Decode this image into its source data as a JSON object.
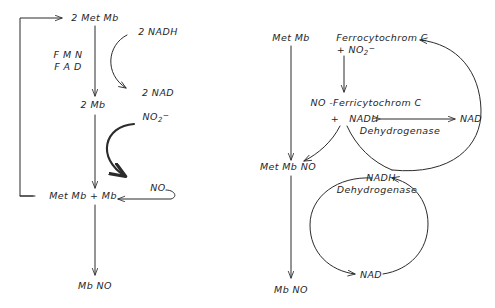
{
  "diagram": {
    "stroke_color": "#2b2b2b",
    "background": "#ffffff",
    "left_scheme": {
      "name": "FMN/FAD mediated MbNO pathway",
      "nodes": {
        "met_mb_2": "2 Met Mb",
        "mb_2": "2  Mb",
        "cofactors_line1": "F M N",
        "cofactors_line2": "F A D",
        "nadh_2": "2 NADH",
        "nad_2": "2 NAD",
        "nitrite": "NO",
        "nitrite_sub": "2",
        "nitrite_sup": "−",
        "met_mb_plus_mb": "Met Mb  +  Mb",
        "no": "NO",
        "mb_no": "Mb NO"
      }
    },
    "right_scheme": {
      "name": "Ferrocytochrome C / NADH dehydrogenase pathway",
      "nodes": {
        "met_mb": "Met Mb",
        "ferrocytochrom_c": "Ferrocytochrom C",
        "plus_nitrite": "+ NO",
        "plus_nitrite_sub": "2",
        "plus_nitrite_sup": "−",
        "no_ferricytochrom_c": "NO -Ferricytochrom C",
        "plus": "+",
        "nadh_top": "NADH",
        "dehydrogenase_top": "Dehydrogenase",
        "nad_top": "NAD",
        "met_mb_no": "Met Mb NO",
        "nadh_bottom": "NADH",
        "dehydrogenase_bottom": "Dehydrogenase",
        "nad_bottom": "NAD",
        "mb_no": "Mb NO"
      }
    }
  }
}
